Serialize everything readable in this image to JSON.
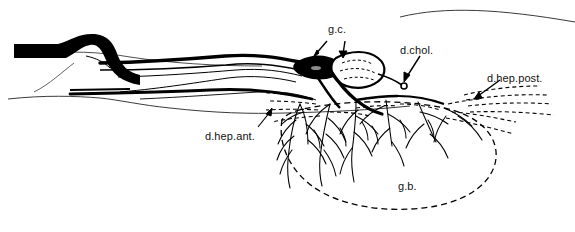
{
  "figure": {
    "kind": "anatomical-line-drawing",
    "background_color": "#ffffff",
    "ink_color": "#000000",
    "contour_color": "#3a3a3a"
  },
  "labels": [
    {
      "id": "gc",
      "text": "g.c.",
      "x": 328,
      "y": 29,
      "arrows": 2
    },
    {
      "id": "dchol",
      "text": "d.chol.",
      "x": 400,
      "y": 44,
      "arrows": 1
    },
    {
      "id": "dheppost",
      "text": "d.hep.post.",
      "x": 487,
      "y": 72,
      "arrows": 1
    },
    {
      "id": "dhepant",
      "text": "d.hep.ant.",
      "x": 205,
      "y": 130,
      "arrows": 1
    },
    {
      "id": "gb",
      "text": "g.b.",
      "x": 398,
      "y": 180,
      "arrows": 0
    }
  ],
  "label_meanings": {
    "gc": "ganglion / nodal structure on duct",
    "dchol": "ductus choledochus",
    "dheppost": "ductus hepaticus posterior",
    "dhepant": "ductus hepaticus anterior",
    "gb": "gallbladder (vesica fellea)"
  },
  "structures": {
    "common_duct": "thick black S-curved duct at left terminating in duodenal papilla",
    "gallbladder_outline": "dashed elongated oval, lower right of centre",
    "duct_tree": "fine black arborizing ducts filling gallbladder bed",
    "posterior_ducts": "dashed ducts fanning to the right margin",
    "liver_contours": "two thin grey contour lines, upper and lower"
  }
}
